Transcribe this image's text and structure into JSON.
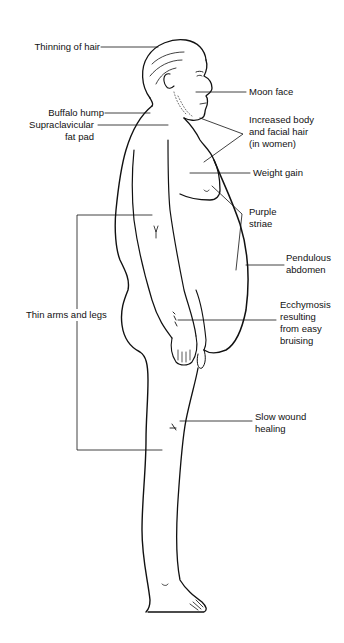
{
  "diagram": {
    "labels": {
      "thinning_hair": "Thinning of hair",
      "buffalo_hump": "Buffalo hump",
      "supraclavicular_1": "Supraclavicular",
      "supraclavicular_2": "fat pad",
      "moon_face": "Moon face",
      "body_hair_1": "Increased body",
      "body_hair_2": "and facial hair",
      "body_hair_3": "(in women)",
      "weight_gain": "Weight gain",
      "purple_striae_1": "Purple",
      "purple_striae_2": "striae",
      "pendulous_1": "Pendulous",
      "pendulous_2": "abdomen",
      "thin_limbs": "Thin arms and legs",
      "ecchymosis_1": "Ecchymosis",
      "ecchymosis_2": "resulting",
      "ecchymosis_3": "from easy",
      "ecchymosis_4": "bruising",
      "slow_wound_1": "Slow wound",
      "slow_wound_2": "healing"
    },
    "colors": {
      "line": "#111111",
      "background": "#ffffff"
    }
  }
}
